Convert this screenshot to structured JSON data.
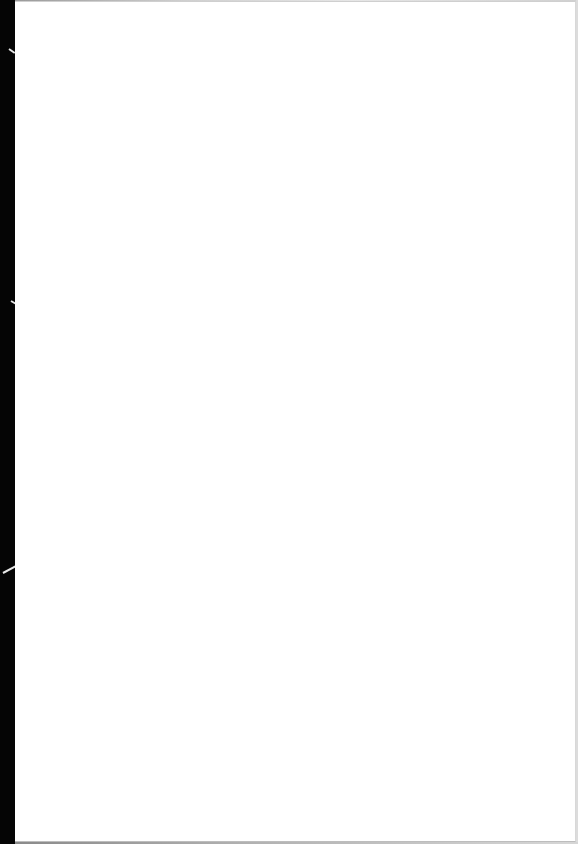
{
  "document": {
    "type": "scanned-page",
    "content": "",
    "colors": {
      "page": "#ffffff",
      "binding_edge": "#050505",
      "page_border": "#cfcfcf"
    }
  }
}
